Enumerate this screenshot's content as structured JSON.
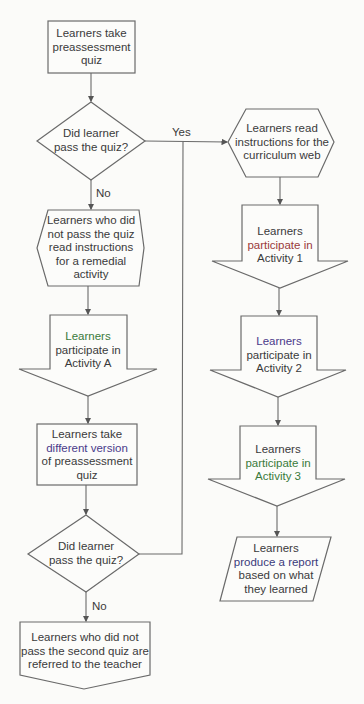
{
  "colors": {
    "background": "#fbfbf9",
    "stroke": "#6a6a6a",
    "text": "#3a3a3a"
  },
  "nodes": {
    "start": {
      "type": "process",
      "lines": [
        "Learners take",
        "preassessment",
        "quiz"
      ]
    },
    "decision1": {
      "type": "decision",
      "lines": [
        "Did learner",
        "pass the quiz?"
      ]
    },
    "remedial_prep": {
      "type": "preparation",
      "lines": [
        "Learners who did",
        "not pass the quiz",
        "read instructions",
        "for a remedial",
        "activity"
      ]
    },
    "activity_a": {
      "type": "offpage",
      "lines": [
        "Learners",
        "participate in",
        "Activity A"
      ]
    },
    "retake": {
      "type": "process",
      "lines": [
        "Learners take",
        "different version",
        "of preassessment",
        "quiz"
      ]
    },
    "decision2": {
      "type": "decision",
      "lines": [
        "Did learner",
        "pass the quiz?"
      ]
    },
    "referred": {
      "type": "offpage",
      "lines": [
        "Learners who did not",
        "pass the second quiz are",
        "referred to the teacher"
      ]
    },
    "web_prep": {
      "type": "preparation",
      "lines": [
        "Learners read",
        "instructions for the",
        "curriculum web"
      ]
    },
    "activity1": {
      "type": "offpage",
      "lines": [
        "Learners",
        "participate in",
        "Activity 1"
      ]
    },
    "activity2": {
      "type": "offpage",
      "lines": [
        "Learners",
        "participate in",
        "Activity 2"
      ]
    },
    "activity3": {
      "type": "offpage",
      "lines": [
        "Learners",
        "participate in",
        "Activity 3"
      ]
    },
    "report": {
      "type": "data",
      "lines": [
        "Learners",
        "produce a report",
        "based on what",
        "they learned"
      ]
    }
  },
  "edges": {
    "yes_label": "Yes",
    "no_label_1": "No",
    "no_label_2": "No"
  }
}
